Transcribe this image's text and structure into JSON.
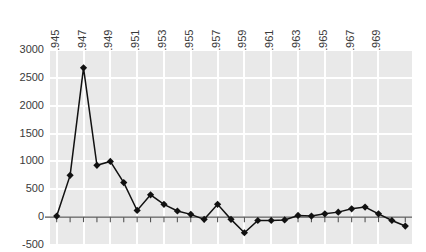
{
  "chart_data": {
    "type": "line",
    "title": "",
    "subtitle": "",
    "xlabel": "",
    "ylabel": "",
    "xlim": [
      1944.5,
      1971.5
    ],
    "ylim": [
      -500,
      3000
    ],
    "yticks": [
      -500,
      0,
      500,
      1000,
      1500,
      2000,
      2500,
      3000
    ],
    "ytick_labels": [
      "-500",
      "0",
      "500",
      "1000",
      "1500",
      "2000",
      "2500",
      "3000"
    ],
    "xticks": [
      1945,
      1947,
      1949,
      1951,
      1953,
      1955,
      1957,
      1959,
      1961,
      1963,
      1965,
      1967,
      1969
    ],
    "xtick_labels": [
      "1945",
      "1947",
      "1949",
      "1951",
      "1953",
      "1955",
      "1957",
      "1959",
      "1961",
      "1963",
      "1965",
      "1967",
      "1969"
    ],
    "xtick_rotation": 90,
    "grid": true,
    "grid_color": "#ffffff",
    "plot_background": "#e9e9e9",
    "legend": null,
    "legend_position": "none",
    "marker": "diamond",
    "line_color": "#111111",
    "x": [
      1945,
      1946,
      1947,
      1948,
      1949,
      1950,
      1951,
      1952,
      1953,
      1954,
      1955,
      1956,
      1957,
      1958,
      1959,
      1960,
      1961,
      1962,
      1963,
      1964,
      1965,
      1966,
      1967,
      1968,
      1969,
      1970,
      1971
    ],
    "values": [
      20,
      750,
      2680,
      930,
      1000,
      620,
      120,
      400,
      230,
      110,
      50,
      -40,
      230,
      -40,
      -280,
      -60,
      -60,
      -50,
      30,
      20,
      60,
      90,
      150,
      180,
      60,
      -60,
      -160
    ],
    "series": [
      {
        "name": "series-1",
        "values": [
          20,
          750,
          2680,
          930,
          1000,
          620,
          120,
          400,
          230,
          110,
          50,
          -40,
          230,
          -40,
          -280,
          -60,
          -60,
          -50,
          30,
          20,
          60,
          90,
          150,
          180,
          60,
          -60,
          -160
        ]
      }
    ]
  },
  "axes": {
    "zero_line": 0
  }
}
